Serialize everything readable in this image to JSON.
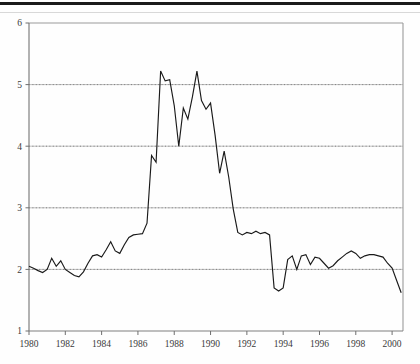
{
  "chart_data": {
    "type": "line",
    "title": "",
    "xlabel": "",
    "ylabel": "",
    "xlim": [
      1980,
      2000.6
    ],
    "ylim": [
      1,
      6
    ],
    "grid": true,
    "gridlines_y": [
      2,
      3,
      4,
      5
    ],
    "legend": "none",
    "xticks": [
      1980,
      1982,
      1984,
      1986,
      1988,
      1990,
      1992,
      1994,
      1996,
      1998,
      2000
    ],
    "xtick_labels": [
      "1980",
      "1982",
      "1984",
      "1986",
      "1988",
      "1990",
      "1992",
      "1994",
      "1996",
      "1998",
      "2000"
    ],
    "yticks": [
      1,
      2,
      3,
      4,
      5,
      6
    ],
    "ytick_labels": [
      "1",
      "2",
      "3",
      "4",
      "5",
      "6"
    ],
    "line_color": "#1a1a1a",
    "series": [
      {
        "name": "series-1",
        "x": [
          1980.0,
          1980.25,
          1980.5,
          1980.75,
          1981.0,
          1981.25,
          1981.5,
          1981.75,
          1982.0,
          1982.25,
          1982.5,
          1982.75,
          1983.0,
          1983.25,
          1983.5,
          1983.75,
          1984.0,
          1984.25,
          1984.5,
          1984.75,
          1985.0,
          1985.25,
          1985.5,
          1985.75,
          1986.0,
          1986.25,
          1986.5,
          1986.75,
          1987.0,
          1987.25,
          1987.5,
          1987.75,
          1988.0,
          1988.25,
          1988.5,
          1988.75,
          1989.0,
          1989.25,
          1989.5,
          1989.75,
          1990.0,
          1990.25,
          1990.5,
          1990.75,
          1991.0,
          1991.25,
          1991.5,
          1991.75,
          1992.0,
          1992.25,
          1992.5,
          1992.75,
          1993.0,
          1993.25,
          1993.5,
          1993.75,
          1994.0,
          1994.25,
          1994.5,
          1994.75,
          1995.0,
          1995.25,
          1995.5,
          1995.75,
          1996.0,
          1996.25,
          1996.5,
          1996.75,
          1997.0,
          1997.25,
          1997.5,
          1997.75,
          1998.0,
          1998.25,
          1998.5,
          1998.75,
          1999.0,
          1999.25,
          1999.5,
          1999.75,
          2000.0,
          2000.25,
          2000.5
        ],
        "y": [
          2.05,
          2.02,
          1.98,
          1.95,
          2.0,
          2.18,
          2.05,
          2.14,
          2.0,
          1.95,
          1.9,
          1.88,
          1.96,
          2.1,
          2.22,
          2.24,
          2.2,
          2.32,
          2.45,
          2.3,
          2.26,
          2.4,
          2.52,
          2.56,
          2.57,
          2.58,
          2.75,
          3.85,
          3.74,
          5.22,
          5.06,
          5.08,
          4.66,
          4.0,
          4.62,
          4.44,
          4.8,
          5.22,
          4.74,
          4.6,
          4.7,
          4.18,
          3.56,
          3.92,
          3.5,
          2.98,
          2.6,
          2.56,
          2.6,
          2.58,
          2.62,
          2.58,
          2.6,
          2.56,
          1.7,
          1.65,
          1.7,
          2.16,
          2.22,
          2.0,
          2.22,
          2.24,
          2.08,
          2.2,
          2.18,
          2.1,
          2.02,
          2.06,
          2.14,
          2.2,
          2.26,
          2.3,
          2.26,
          2.18,
          2.22,
          2.24,
          2.24,
          2.22,
          2.2,
          2.1,
          2.02,
          1.82,
          1.62
        ]
      }
    ]
  },
  "axes": {
    "frame_color": "#9a9a9a",
    "gridline_color": "#b8b8b8"
  }
}
